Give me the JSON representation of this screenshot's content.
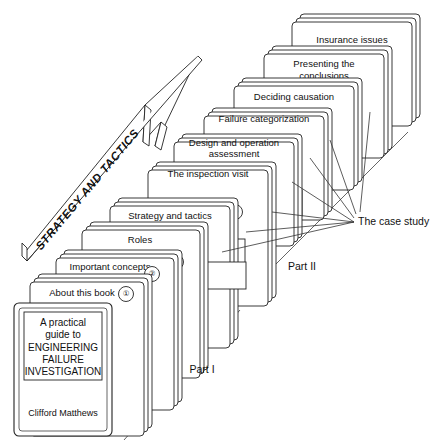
{
  "diagram": {
    "banner": {
      "label": "STRATEGY AND TACTICS",
      "name": "strategy-and-tactics-arrow"
    },
    "book_cover": {
      "line1": "A practical",
      "line2": "guide to",
      "line3": "ENGINEERING",
      "line4": "FAILURE",
      "line5": "INVESTIGATION",
      "author": "Clifford Matthews"
    },
    "chapters": [
      {
        "num": "①",
        "label": "About this book",
        "label2": ""
      },
      {
        "num": "②",
        "label": "Important concepts",
        "label2": ""
      },
      {
        "num": "③",
        "label": "Roles",
        "label2": ""
      },
      {
        "num": "④",
        "label": "Strategy and tactics",
        "label2": ""
      },
      {
        "num": "⑤",
        "label": "The inspection visit",
        "label2": ""
      },
      {
        "num": "⑥",
        "label": "Design and operation",
        "label2": "assessment"
      },
      {
        "num": "⑦",
        "label": "Failure categorization",
        "label2": ""
      },
      {
        "num": "⑧",
        "label": "Deciding causation",
        "label2": ""
      },
      {
        "num": "⑨",
        "label": "Presenting the",
        "label2": "conclusions"
      },
      {
        "num": "⑩",
        "label": "Insurance issues",
        "label2": ""
      }
    ],
    "annotations": {
      "case_study": "The case study",
      "part_one": "Part I",
      "part_two": "Part II"
    },
    "colors": {
      "ink": "#111111",
      "line": "#444444",
      "paper": "#ffffff"
    }
  }
}
